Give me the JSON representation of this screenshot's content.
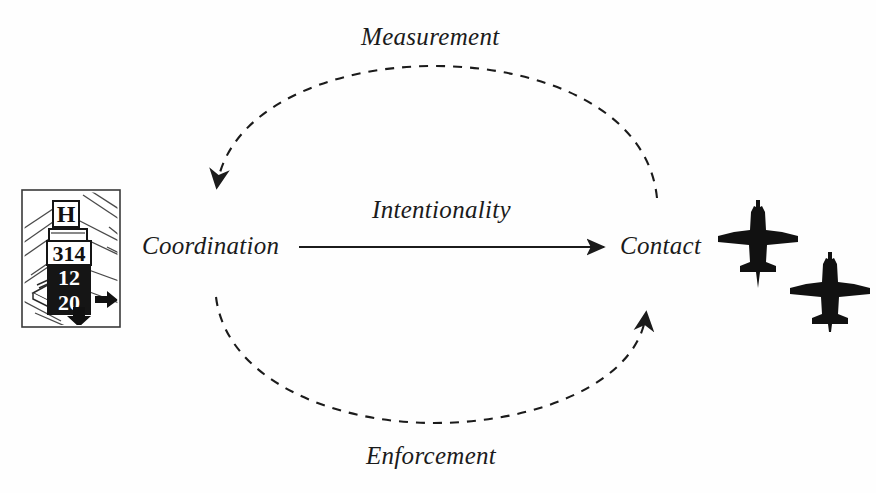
{
  "figure": {
    "domain": "diagram",
    "background_color": "#fefefe",
    "ink_color": "#1b1b1b",
    "width": 876,
    "height": 493
  },
  "nodes": [
    {
      "id": "coordination",
      "label": "Coordination"
    },
    {
      "id": "contact",
      "label": "Contact"
    }
  ],
  "edges": [
    {
      "id": "measurement",
      "label": "Measurement",
      "style": "dashed",
      "from": "contact",
      "to": "coordination",
      "path": "arc-above"
    },
    {
      "id": "intentionality",
      "label": "Intentionality",
      "style": "solid",
      "from": "coordination",
      "to": "contact",
      "path": "straight"
    },
    {
      "id": "enforcement",
      "label": "Enforcement",
      "style": "dashed",
      "from": "coordination",
      "to": "contact",
      "path": "arc-below"
    }
  ],
  "illustrations": {
    "signal_tower": {
      "name": "airport-signal-tower",
      "caption": "",
      "panels": [
        "H",
        "314",
        "12",
        "20"
      ]
    },
    "aircraft": {
      "name": "two-aircraft-silhouettes",
      "count": 2,
      "color": "#111111"
    }
  }
}
